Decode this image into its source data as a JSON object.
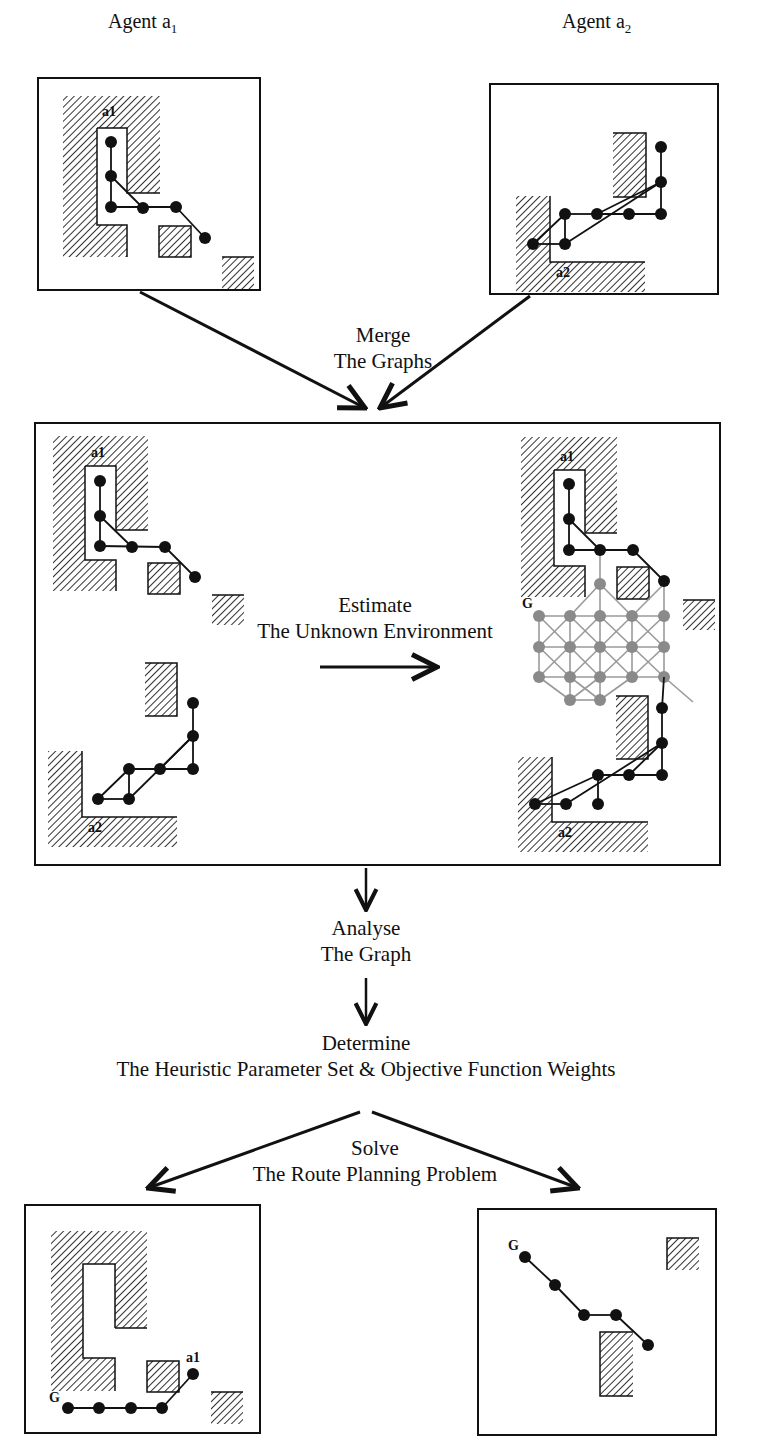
{
  "header": {
    "agent_a1_label": "Agent a",
    "agent_a1_sub": "1",
    "agent_a2_label": "Agent a",
    "agent_a2_sub": "2"
  },
  "steps": {
    "merge": {
      "line1": "Merge",
      "line2": "The Graphs"
    },
    "estimate": {
      "line1": "Estimate",
      "line2": "The Unknown Environment"
    },
    "analyse": {
      "line1": "Analyse",
      "line2": "The Graph"
    },
    "determine": {
      "line1": "Determine",
      "line2": "The Heuristic Parameter Set & Objective Function Weights"
    },
    "solve": {
      "line1": "Solve",
      "line2": "The Route Planning Problem"
    }
  },
  "map_labels": {
    "a1": "a1",
    "a2": "a2",
    "goal": "G"
  },
  "colors": {
    "line": "#111111",
    "node_known": "#111111",
    "node_estimated": "#8a8a8a",
    "edge_estimated": "#9a9a9a",
    "hatch": "#333333"
  }
}
